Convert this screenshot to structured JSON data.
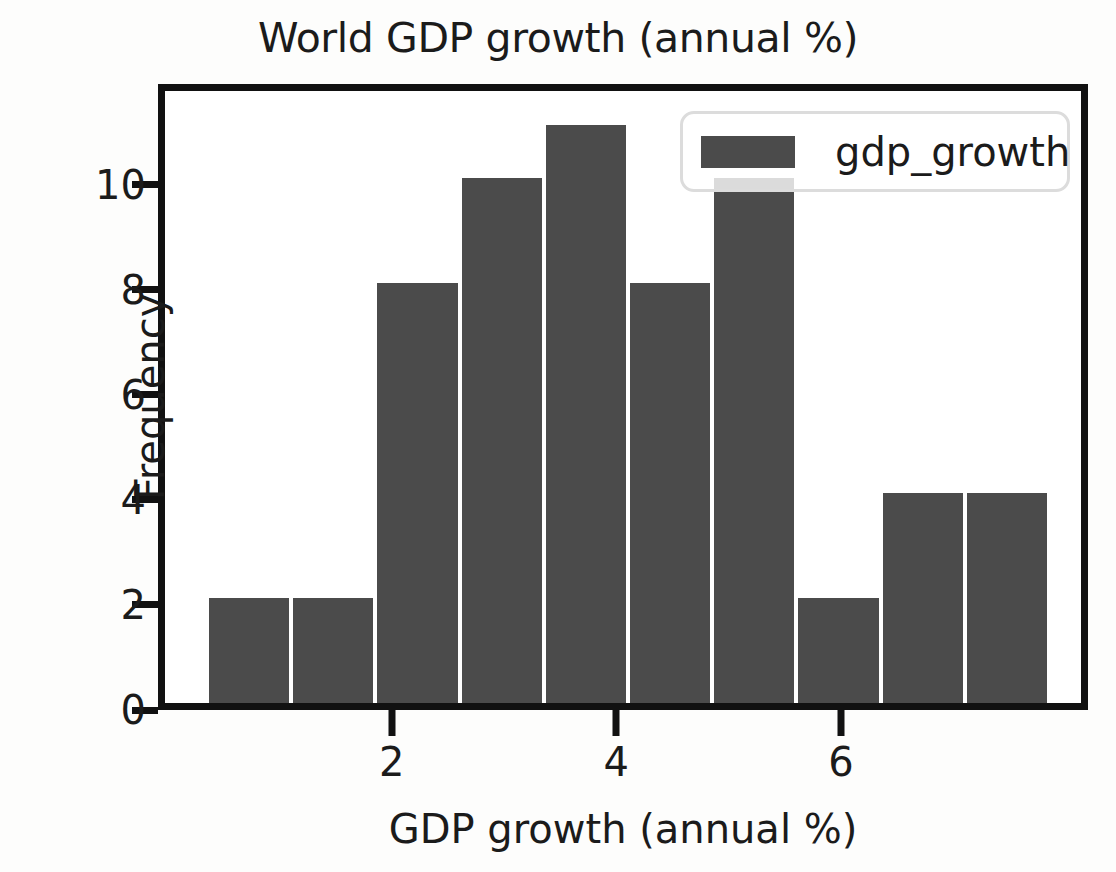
{
  "chart_data": {
    "type": "bar",
    "title": "World GDP growth (annual %)",
    "xlabel": "GDP growth (annual %)",
    "ylabel": "Frequency",
    "grid": false,
    "legend_position": "upper right",
    "bar_color": "#4b4b4b",
    "legend": [
      {
        "name": "gdp_growth",
        "color": "#4b4b4b"
      }
    ],
    "xlim": [
      -0.08,
      8.2
    ],
    "ylim": [
      0,
      11.92
    ],
    "xticks": [
      2,
      4,
      6
    ],
    "xtick_labels": [
      "2",
      "4",
      "6"
    ],
    "yticks": [
      0,
      2,
      4,
      6,
      8,
      10
    ],
    "ytick_labels": [
      "0",
      "2",
      "4",
      "6",
      "8",
      "10"
    ],
    "bin_width": 0.75,
    "bin_edges": [
      0.31,
      1.06,
      1.81,
      2.56,
      3.31,
      4.06,
      4.81,
      5.56,
      6.31,
      7.06,
      7.81
    ],
    "bin_centers": [
      0.685,
      1.435,
      2.185,
      2.935,
      3.685,
      4.435,
      5.185,
      5.935,
      6.685,
      7.435
    ],
    "values": [
      2,
      2,
      8,
      10,
      11,
      8,
      10,
      2,
      4,
      4
    ],
    "series": [
      {
        "name": "gdp_growth",
        "values": [
          2,
          2,
          8,
          10,
          11,
          8,
          10,
          2,
          4,
          4
        ]
      }
    ]
  }
}
